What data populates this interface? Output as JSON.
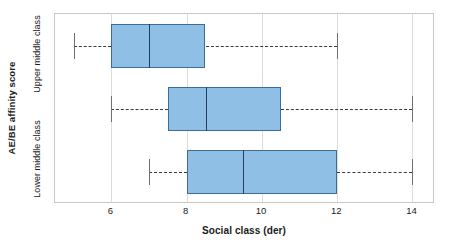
{
  "chart_data": {
    "type": "box",
    "title": "",
    "orientation": "horizontal",
    "xlabel": "Social class (der)",
    "ylabel": "AE/BE affinity score",
    "xlim": [
      4.5,
      14.6
    ],
    "xticks": [
      6,
      8,
      10,
      12,
      14
    ],
    "xtick_labels": [
      "6",
      "8",
      "10",
      "12",
      "14"
    ],
    "grid": true,
    "grid_axis": "x",
    "legend": "none",
    "categories": [
      "Upper middle class",
      "",
      "Lower middle class"
    ],
    "boxes": [
      {
        "category": "Upper middle class",
        "whisker_low": 5.0,
        "q1": 6.0,
        "median": 7.0,
        "q3": 8.5,
        "whisker_high": 12.0
      },
      {
        "category": "",
        "whisker_low": 6.0,
        "q1": 7.5,
        "median": 8.5,
        "q3": 10.5,
        "whisker_high": 14.0
      },
      {
        "category": "Lower middle class",
        "whisker_low": 7.0,
        "q1": 8.0,
        "median": 9.5,
        "q3": 12.0,
        "whisker_high": 14.0
      }
    ],
    "colors": {
      "box_fill": "#8fbfe4",
      "box_edge": "#3d6d96",
      "median": "#1f3f5c",
      "whisker": "#3a3a3a",
      "grid": "#dcdcdc",
      "frame": "#c9c9c9",
      "text": "#1a1a1a"
    }
  },
  "axis": {
    "y_title": "AE/BE affinity score",
    "y_categories": [
      {
        "label": "Upper middle class"
      },
      {
        "label": "Lower middle class"
      }
    ],
    "x_title": "Social class (der)",
    "x_tick_labels": [
      "6",
      "8",
      "10",
      "12",
      "14"
    ]
  }
}
